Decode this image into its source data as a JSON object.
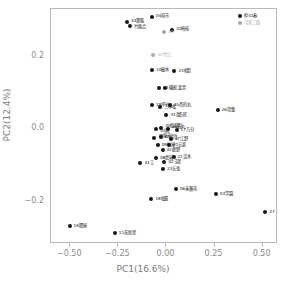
{
  "chart_data": {
    "type": "scatter",
    "title": "",
    "xlabel": "PC1(16.6%)",
    "ylabel": "PC2(12.4%)",
    "xlim": [
      -0.6,
      0.58
    ],
    "ylim": [
      -0.32,
      0.33
    ],
    "xticks": [
      -0.5,
      -0.25,
      0.0,
      0.25,
      0.5
    ],
    "xticklabels": [
      "−0.50",
      "−0.25",
      "0.00",
      "0.25",
      "0.50"
    ],
    "yticks": [
      0.2,
      0.0,
      -0.2
    ],
    "yticklabels": [
      "0.2",
      "0.0",
      "−0.2"
    ],
    "grid": false,
    "legend": "none",
    "point_colors": {
      "primary": "#161616",
      "secondary": "#a8a8a8"
    },
    "points": [
      {
        "label": "04前市",
        "x": -0.07,
        "y": 0.305,
        "color": "black",
        "lx": 4,
        "ly": -1
      },
      {
        "label": "44那能",
        "x": -0.2,
        "y": 0.292,
        "color": "black",
        "lx": 4,
        "ly": -1
      },
      {
        "label": "竹能合",
        "x": -0.182,
        "y": 0.281,
        "color": "black",
        "lx": 4,
        "ly": 1
      },
      {
        "label": "42梅枝",
        "x": 0.035,
        "y": 0.268,
        "color": "black",
        "lx": 4,
        "ly": -1
      },
      {
        "label": "13",
        "x": -0.008,
        "y": 0.263,
        "color": "gray",
        "lx": 4,
        "ly": 0
      },
      {
        "label": "12竹江",
        "x": -0.062,
        "y": 0.2,
        "color": "gray",
        "lx": 4,
        "ly": 0
      },
      {
        "label": "10樹木",
        "x": -0.068,
        "y": 0.158,
        "color": "black",
        "lx": 4,
        "ly": 0
      },
      {
        "label": "23相音",
        "x": 0.047,
        "y": 0.155,
        "color": "black",
        "lx": 4,
        "ly": 0
      },
      {
        "label": "13",
        "x": -0.033,
        "y": 0.11,
        "color": "black",
        "lx": 4,
        "ly": 0
      },
      {
        "label": "磯蛇.富音",
        "x": -0.003,
        "y": 0.108,
        "color": "black",
        "lx": 4,
        "ly": 0
      },
      {
        "label": "19坪岩",
        "x": -0.07,
        "y": 0.063,
        "color": "black",
        "lx": 4,
        "ly": 0
      },
      {
        "label": "二本松",
        "x": -0.028,
        "y": 0.055,
        "color": "black",
        "lx": 4,
        "ly": 0
      },
      {
        "label": "45西的丸",
        "x": 0.022,
        "y": 0.062,
        "color": "black",
        "lx": 4,
        "ly": 0
      },
      {
        "label": "26常盤",
        "x": 0.272,
        "y": 0.047,
        "color": "black",
        "lx": 4,
        "ly": 0
      },
      {
        "label": "31真名旺",
        "x": 0.005,
        "y": 0.035,
        "color": "black",
        "lx": 4,
        "ly": 0
      },
      {
        "label": "30船越町",
        "x": -0.022,
        "y": -0.002,
        "color": "black",
        "lx": 4,
        "ly": -2
      },
      {
        "label": "43前",
        "x": -0.048,
        "y": -0.005,
        "color": "black",
        "lx": 4,
        "ly": 2
      },
      {
        "label": "25石丸",
        "x": 0.012,
        "y": -0.004,
        "color": "black",
        "lx": 4,
        "ly": -2
      },
      {
        "label": "17万分",
        "x": 0.058,
        "y": -0.007,
        "color": "black",
        "lx": 4,
        "ly": 0
      },
      {
        "label": "38東市",
        "x": -0.058,
        "y": -0.03,
        "color": "black",
        "lx": 4,
        "ly": -2
      },
      {
        "label": "05相生",
        "x": -0.022,
        "y": -0.028,
        "color": "black",
        "lx": 4,
        "ly": 0
      },
      {
        "label": "47江野",
        "x": 0.028,
        "y": -0.032,
        "color": "black",
        "lx": 4,
        "ly": 0
      },
      {
        "label": "09竹屋",
        "x": -0.04,
        "y": -0.048,
        "color": "black",
        "lx": 4,
        "ly": 0
      },
      {
        "label": "21五倉",
        "x": 0.02,
        "y": -0.05,
        "color": "black",
        "lx": 4,
        "ly": 0
      },
      {
        "label": "32藤野",
        "x": -0.015,
        "y": -0.062,
        "color": "black",
        "lx": 4,
        "ly": 0
      },
      {
        "label": "41工",
        "x": -0.13,
        "y": -0.1,
        "color": "black",
        "lx": 4,
        "ly": 0
      },
      {
        "label": "08島城",
        "x": -0.048,
        "y": -0.085,
        "color": "black",
        "lx": 4,
        "ly": 0
      },
      {
        "label": "22沼木",
        "x": 0.042,
        "y": -0.082,
        "color": "black",
        "lx": 4,
        "ly": 0
      },
      {
        "label": "02玉里",
        "x": -0.005,
        "y": -0.097,
        "color": "black",
        "lx": 4,
        "ly": 0
      },
      {
        "label": "23五鬼",
        "x": -0.012,
        "y": -0.115,
        "color": "black",
        "lx": 4,
        "ly": 0
      },
      {
        "label": "06末廣花",
        "x": 0.055,
        "y": -0.17,
        "color": "black",
        "lx": 4,
        "ly": 0
      },
      {
        "label": "03学園",
        "x": 0.262,
        "y": -0.185,
        "color": "black",
        "lx": 4,
        "ly": 0
      },
      {
        "label": "18松風",
        "x": -0.073,
        "y": -0.198,
        "color": "black",
        "lx": 4,
        "ly": 0
      },
      {
        "label": "27",
        "x": 0.52,
        "y": -0.233,
        "color": "black",
        "lx": 4,
        "ly": 0
      },
      {
        "label": "16関屋",
        "x": -0.498,
        "y": -0.272,
        "color": "black",
        "lx": 4,
        "ly": 0
      },
      {
        "label": "11花新里",
        "x": -0.263,
        "y": -0.292,
        "color": "black",
        "lx": 4,
        "ly": 0
      },
      {
        "label": "枠41春",
        "x": 0.39,
        "y": 0.308,
        "color": "black",
        "lx": 4,
        "ly": 0
      },
      {
        "label": "弓宮二船",
        "x": 0.388,
        "y": 0.288,
        "color": "gray",
        "lx": 4,
        "ly": 0
      }
    ]
  }
}
